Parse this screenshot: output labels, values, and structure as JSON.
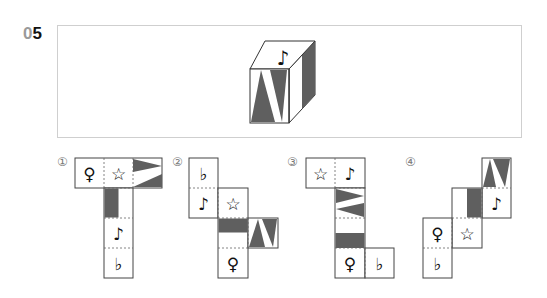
{
  "question": {
    "number_prefix": "0",
    "number": "5"
  },
  "cube": {
    "top_symbol": "♪",
    "front_pattern": "two-triangles-V",
    "right_pattern": "half-shaded-stripe"
  },
  "colors": {
    "shade": "#5f5f5f",
    "line": "#333333",
    "frame": "#cfcfcf",
    "label": "#7a7a7a"
  },
  "options": [
    {
      "label": "①",
      "symbols": [
        "♀",
        "☆",
        "♪",
        "♭"
      ]
    },
    {
      "label": "②",
      "symbols": [
        "♭",
        "♪",
        "☆",
        "♀"
      ]
    },
    {
      "label": "③",
      "symbols": [
        "☆",
        "♪",
        "♀",
        "♭"
      ]
    },
    {
      "label": "④",
      "symbols": [
        "♀",
        "☆",
        "♪",
        "♭"
      ]
    }
  ]
}
